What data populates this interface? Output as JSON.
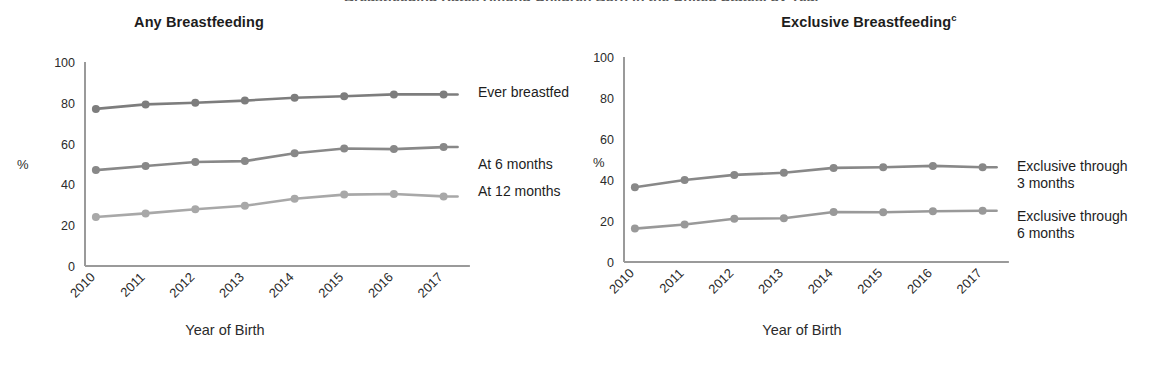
{
  "figure": {
    "clipped_caption": "Breastfeeding Rates Among Children Born in the United States, by Year",
    "axis_unit_symbol": "%",
    "x_axis_title": "Year of Birth"
  },
  "chart_data": [
    {
      "type": "line",
      "title": "Any Breastfeeding",
      "title_superscript": "",
      "xlabel": "Year of Birth",
      "ylabel": "%",
      "categories": [
        "2010",
        "2011",
        "2012",
        "2013",
        "2014",
        "2015",
        "2016",
        "2017"
      ],
      "ylim": [
        0,
        100
      ],
      "yticks": [
        0,
        20,
        40,
        60,
        80,
        100
      ],
      "grid": false,
      "legend_position": "right-inline",
      "series": [
        {
          "name": "Ever breastfed",
          "color": "#7d7d7d",
          "values": [
            77.0,
            79.2,
            80.0,
            81.1,
            82.5,
            83.2,
            84.1,
            84.1
          ]
        },
        {
          "name": "At 6 months",
          "color": "#888888",
          "values": [
            47.0,
            49.0,
            51.0,
            51.4,
            55.3,
            57.6,
            57.3,
            58.3
          ]
        },
        {
          "name": "At 12 months",
          "color": "#a8a8a8",
          "values": [
            24.0,
            25.8,
            27.8,
            29.5,
            33.0,
            35.0,
            35.3,
            34.1
          ]
        }
      ]
    },
    {
      "type": "line",
      "title": "Exclusive Breastfeeding",
      "title_superscript": "c",
      "xlabel": "Year of Birth",
      "ylabel": "%",
      "categories": [
        "2010",
        "2011",
        "2012",
        "2013",
        "2014",
        "2015",
        "2016",
        "2017"
      ],
      "ylim": [
        0,
        100
      ],
      "yticks": [
        0,
        20,
        40,
        60,
        80,
        100
      ],
      "grid": false,
      "legend_position": "right-inline",
      "series": [
        {
          "name": "Exclusive through 3 months",
          "legend_line1": "Exclusive through",
          "legend_line2": "3 months",
          "color": "#888888",
          "values": [
            36.5,
            40.0,
            42.5,
            43.5,
            45.9,
            46.2,
            46.9,
            46.2
          ]
        },
        {
          "name": "Exclusive through 6 months",
          "legend_line1": "Exclusive through",
          "legend_line2": "6 months",
          "color": "#999999",
          "values": [
            16.3,
            18.3,
            21.1,
            21.3,
            24.4,
            24.3,
            24.8,
            25.0
          ]
        }
      ]
    }
  ]
}
